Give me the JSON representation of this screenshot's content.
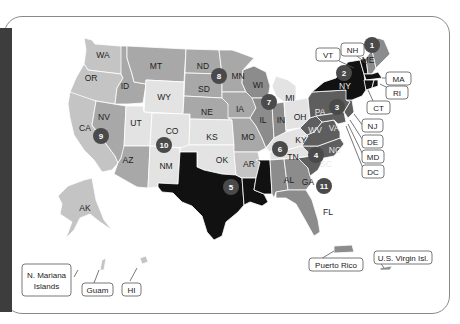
{
  "colors": {
    "lightest": "#e3e3e3",
    "light": "#c4c4c4",
    "medium": "#a8a8a8",
    "medium_dark": "#8c8c8c",
    "dark": "#5e5e5e",
    "darkest": "#111111",
    "badge": "#4a4a4a",
    "sidebar": "#3d3d3d"
  },
  "states": [
    {
      "code": "WA",
      "shade": "light"
    },
    {
      "code": "OR",
      "shade": "light"
    },
    {
      "code": "CA",
      "shade": "light"
    },
    {
      "code": "NV",
      "shade": "medium"
    },
    {
      "code": "ID",
      "shade": "medium"
    },
    {
      "code": "MT",
      "shade": "medium"
    },
    {
      "code": "WY",
      "shade": "lightest"
    },
    {
      "code": "UT",
      "shade": "lightest"
    },
    {
      "code": "CO",
      "shade": "lightest"
    },
    {
      "code": "AZ",
      "shade": "medium"
    },
    {
      "code": "NM",
      "shade": "lightest"
    },
    {
      "code": "ND",
      "shade": "medium"
    },
    {
      "code": "SD",
      "shade": "medium"
    },
    {
      "code": "NE",
      "shade": "medium"
    },
    {
      "code": "KS",
      "shade": "lightest"
    },
    {
      "code": "OK",
      "shade": "lightest"
    },
    {
      "code": "TX",
      "shade": "darkest"
    },
    {
      "code": "MN",
      "shade": "medium"
    },
    {
      "code": "IA",
      "shade": "medium"
    },
    {
      "code": "MO",
      "shade": "medium"
    },
    {
      "code": "AR",
      "shade": "light"
    },
    {
      "code": "LA",
      "shade": "darkest"
    },
    {
      "code": "WI",
      "shade": "medium_dark"
    },
    {
      "code": "IL",
      "shade": "medium_dark"
    },
    {
      "code": "MS",
      "shade": "darkest"
    },
    {
      "code": "MI",
      "shade": "lightest"
    },
    {
      "code": "IN",
      "shade": "medium_dark"
    },
    {
      "code": "OH",
      "shade": "lightest"
    },
    {
      "code": "KY",
      "shade": "lightest"
    },
    {
      "code": "TN",
      "shade": "lightest"
    },
    {
      "code": "AL",
      "shade": "medium_dark"
    },
    {
      "code": "GA",
      "shade": "medium_dark"
    },
    {
      "code": "FL",
      "shade": "medium_dark"
    },
    {
      "code": "SC",
      "shade": "dark"
    },
    {
      "code": "NC",
      "shade": "dark"
    },
    {
      "code": "VA",
      "shade": "dark"
    },
    {
      "code": "WV",
      "shade": "dark"
    },
    {
      "code": "PA",
      "shade": "dark"
    },
    {
      "code": "NY",
      "shade": "darkest"
    },
    {
      "code": "VT",
      "shade": "darkest"
    },
    {
      "code": "NH",
      "shade": "medium_dark"
    },
    {
      "code": "ME",
      "shade": "medium_dark"
    },
    {
      "code": "MA",
      "shade": "darkest"
    },
    {
      "code": "RI",
      "shade": "darkest"
    },
    {
      "code": "CT",
      "shade": "darkest"
    },
    {
      "code": "NJ",
      "shade": "dark"
    },
    {
      "code": "DE",
      "shade": "dark"
    },
    {
      "code": "MD",
      "shade": "dark"
    },
    {
      "code": "DC",
      "shade": "dark"
    },
    {
      "code": "AK",
      "shade": "light"
    },
    {
      "code": "HI",
      "shade": "light"
    },
    {
      "code": "PR",
      "shade": "medium_dark"
    }
  ],
  "labels": {
    "WA": "WA",
    "OR": "OR",
    "CA": "CA",
    "NV": "NV",
    "ID": "ID",
    "MT": "MT",
    "WY": "WY",
    "UT": "UT",
    "CO": "CO",
    "AZ": "AZ",
    "NM": "NM",
    "ND": "ND",
    "SD": "SD",
    "NE": "NE",
    "KS": "KS",
    "OK": "OK",
    "MN": "MN",
    "IA": "IA",
    "MO": "MO",
    "AR": "AR",
    "WI": "WI",
    "IL": "IL",
    "MI": "MI",
    "IN": "IN",
    "OH": "OH",
    "KY": "KY",
    "TN": "TN",
    "AL": "AL",
    "GA": "GA",
    "FL": "FL",
    "SC": "SC",
    "NC": "NC",
    "VA": "VA",
    "WV": "WV",
    "PA": "PA",
    "NY": "NY",
    "ME": "ME",
    "AK": "AK"
  },
  "callouts": {
    "VT": "VT",
    "NH": "NH",
    "MA": "MA",
    "RI": "RI",
    "CT": "CT",
    "NJ": "NJ",
    "DE": "DE",
    "MD": "MD",
    "DC": "DC",
    "N_Mariana_line1": "N. Mariana",
    "N_Mariana_line2": "Islands",
    "Guam": "Guam",
    "HI": "HI",
    "Puerto_Rico": "Puerto Rico",
    "US_Virgin_Isl": "U.S. Virgin Isl."
  },
  "badges": [
    {
      "num": "1",
      "near": "ME"
    },
    {
      "num": "2",
      "near": "NY"
    },
    {
      "num": "3",
      "near": "PA"
    },
    {
      "num": "4",
      "near": "NC/SC"
    },
    {
      "num": "5",
      "near": "TX"
    },
    {
      "num": "6",
      "near": "TN"
    },
    {
      "num": "7",
      "near": "IL"
    },
    {
      "num": "8",
      "near": "ND/MN"
    },
    {
      "num": "9",
      "near": "CA"
    },
    {
      "num": "10",
      "near": "CO"
    },
    {
      "num": "11",
      "near": "GA"
    }
  ]
}
